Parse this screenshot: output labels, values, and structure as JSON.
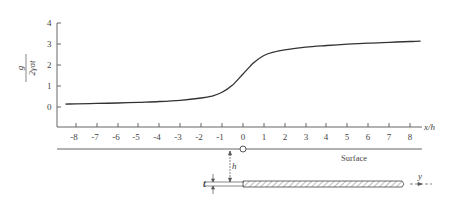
{
  "figure": {
    "y_axis_label_numerator": "g",
    "y_axis_label_denominator": "2γσt",
    "x_axis_label": "x/h",
    "surface_label": "Surface",
    "h_label": "h",
    "t_label": "t",
    "y_label": "y"
  },
  "chart_data": {
    "type": "line",
    "title": "",
    "xlabel": "x/h",
    "ylabel": "g/(2γσt)",
    "xlim": [
      -8.5,
      8.5
    ],
    "ylim": [
      -0.6,
      4
    ],
    "x_ticks": [
      "-8",
      "-7",
      "-6",
      "-5",
      "-4",
      "-3",
      "-2",
      "-1",
      "0",
      "1",
      "2",
      "3",
      "4",
      "5",
      "6",
      "7",
      "8"
    ],
    "y_ticks": [
      "0",
      "1",
      "2",
      "3",
      "4"
    ],
    "grid": false,
    "series": [
      {
        "name": "g/(2γσt)",
        "x": [
          -8.5,
          -8,
          -7,
          -6,
          -5,
          -4,
          -3,
          -2,
          -1.5,
          -1,
          -0.5,
          0,
          0.5,
          1,
          1.5,
          2,
          3,
          4,
          5,
          6,
          7,
          8,
          8.5
        ],
        "values": [
          0.14,
          0.15,
          0.17,
          0.19,
          0.22,
          0.26,
          0.32,
          0.43,
          0.52,
          0.7,
          1.05,
          1.57,
          2.1,
          2.45,
          2.62,
          2.72,
          2.85,
          2.93,
          2.99,
          3.04,
          3.08,
          3.12,
          3.14
        ]
      }
    ]
  }
}
